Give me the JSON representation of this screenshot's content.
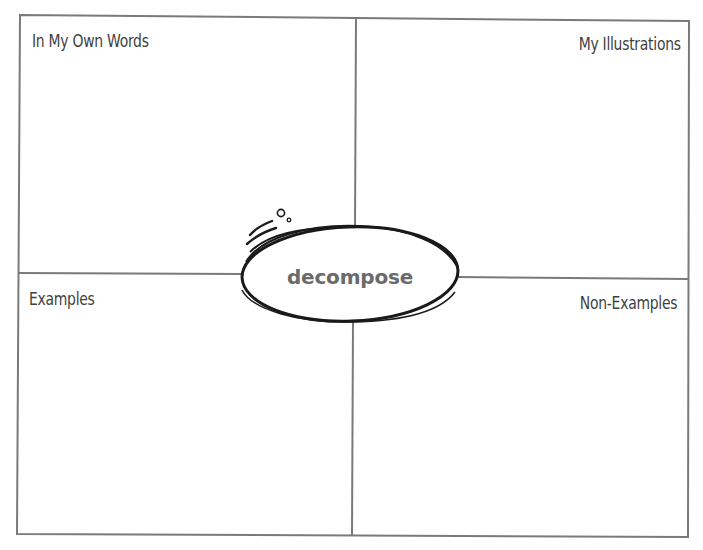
{
  "worksheet": {
    "term": "decompose",
    "quadrants": {
      "top_left": {
        "label": "In My Own Words"
      },
      "top_right": {
        "label": "My Illustrations"
      },
      "bottom_left": {
        "label": "Examples"
      },
      "bottom_right": {
        "label": "Non-Examples"
      }
    }
  },
  "colors": {
    "line": "#7a7a7a",
    "label_text": "#3f3f3f",
    "term_text": "#6a6a6a",
    "ellipse_stroke": "#1a1a1a"
  }
}
